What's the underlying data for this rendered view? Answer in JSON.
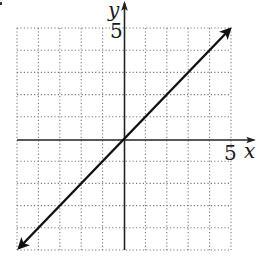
{
  "chart_data": {
    "type": "line",
    "title": "",
    "xlabel": "x",
    "ylabel": "y",
    "xlim": [
      -5,
      5
    ],
    "ylim": [
      -5,
      5
    ],
    "grid": true,
    "grid_style": "dotted",
    "x_tick_labels": [
      {
        "value": 5,
        "label": "5"
      }
    ],
    "y_tick_labels": [
      {
        "value": 5,
        "label": "5"
      }
    ],
    "series": [
      {
        "name": "y = x",
        "x": [
          -5,
          5
        ],
        "y": [
          -5,
          5
        ],
        "arrows": "both-ends"
      }
    ],
    "legend": null
  },
  "labels": {
    "x_axis": "x",
    "y_axis": "y",
    "x_tick": "5",
    "y_tick": "5"
  },
  "colors": {
    "line": "#111111",
    "axis": "#222222",
    "grid": "#7a7a7a",
    "background": "#ffffff"
  }
}
